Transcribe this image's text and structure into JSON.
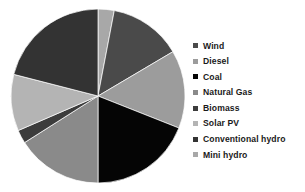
{
  "chart_data": {
    "type": "pie",
    "title": "",
    "legend_position": "right",
    "start_angle_deg": 0,
    "direction": "clockwise",
    "categories": [
      "Wind",
      "Diesel",
      "Coal",
      "Natural Gas",
      "Biomass",
      "Solar PV",
      "Conventional hydro",
      "Mini hydro"
    ],
    "values": [
      13.5,
      14.5,
      19.0,
      16.0,
      2.5,
      10.5,
      21.0,
      3.0
    ],
    "colors": [
      "#4a4a4a",
      "#9c9c9c",
      "#050505",
      "#8a8a8a",
      "#3c3c3c",
      "#b4b4b4",
      "#333333",
      "#a8a8a8"
    ],
    "slices": [
      {
        "label": "Mini hydro",
        "value": 3.0,
        "color": "#a8a8a8"
      },
      {
        "label": "Wind",
        "value": 13.5,
        "color": "#4a4a4a"
      },
      {
        "label": "Diesel",
        "value": 14.5,
        "color": "#9c9c9c"
      },
      {
        "label": "Coal",
        "value": 19.0,
        "color": "#050505"
      },
      {
        "label": "Natural Gas",
        "value": 16.0,
        "color": "#8a8a8a"
      },
      {
        "label": "Biomass",
        "value": 2.5,
        "color": "#3c3c3c"
      },
      {
        "label": "Solar PV",
        "value": 10.5,
        "color": "#b4b4b4"
      },
      {
        "label": "Conventional hydro",
        "value": 21.0,
        "color": "#333333"
      }
    ]
  },
  "legend": {
    "items": [
      {
        "label": "Wind",
        "color": "#4a4a4a"
      },
      {
        "label": "Diesel",
        "color": "#9c9c9c"
      },
      {
        "label": "Coal",
        "color": "#050505"
      },
      {
        "label": "Natural Gas",
        "color": "#8a8a8a"
      },
      {
        "label": "Biomass",
        "color": "#3c3c3c"
      },
      {
        "label": "Solar PV",
        "color": "#b4b4b4"
      },
      {
        "label": "Conventional hydro",
        "color": "#333333"
      },
      {
        "label": "Mini hydro",
        "color": "#a8a8a8"
      }
    ]
  }
}
